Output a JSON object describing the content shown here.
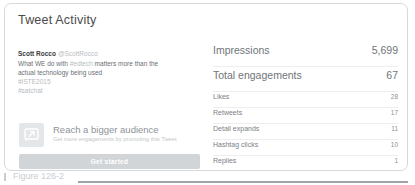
{
  "card": {
    "title": "Tweet Activity"
  },
  "tweet": {
    "author": "Scott Rocco",
    "handle": "@ScottRocco",
    "body_line_1": "What WE do with ",
    "body_hashtag": "#edtech",
    "body_line_1_end": " matters more than the",
    "body_line_2": "actual technology being used",
    "tag_1": "#ISTE2015",
    "tag_2": "#satchat"
  },
  "promote": {
    "icon": "promote-arrow-icon",
    "title": "Reach a bigger audience",
    "subtitle": "Get more engagements by promoting this Tweet",
    "button_label": "Get started"
  },
  "metrics": {
    "primary": [
      {
        "label": "Impressions",
        "value": "5,699"
      },
      {
        "label": "Total engagements",
        "value": "67"
      }
    ],
    "secondary": [
      {
        "label": "Likes",
        "value": "28"
      },
      {
        "label": "Retweets",
        "value": "17"
      },
      {
        "label": "Detail expands",
        "value": "11"
      },
      {
        "label": "Hashtag clicks",
        "value": "10"
      },
      {
        "label": "Replies",
        "value": "1"
      }
    ]
  },
  "figure": {
    "caption": "Figure 126-2"
  },
  "colors": {
    "card_border": "#d6d9dc",
    "button_bg": "#d2d5d8",
    "text_primary": "#6f7579",
    "text_muted": "#b6bcc2"
  }
}
